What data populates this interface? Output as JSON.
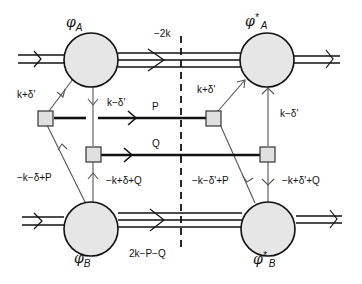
{
  "diagram": {
    "type": "feynman-like cut diagram",
    "colors": {
      "blob_fill": "#e6e6e6",
      "line": "#111111",
      "thin_line": "#555555",
      "vertex_fill": "#e0e0e0"
    },
    "blobs": {
      "phi_A": {
        "symbol": "φ",
        "star": "",
        "sub": "A"
      },
      "phi_A_star": {
        "symbol": "φ",
        "star": "*",
        "sub": "A"
      },
      "phi_B": {
        "symbol": "φ",
        "star": "",
        "sub": "B"
      },
      "phi_B_star": {
        "symbol": "φ",
        "star": "*",
        "sub": "B"
      }
    },
    "labels": {
      "top_momentum": "−2k",
      "bottom_momentum": "2k−P−Q",
      "left_upper": "k+δ'",
      "left_inner": "k−δ'",
      "right_upper": "k+δ'",
      "right_inner": "k−δ'",
      "P": "P",
      "Q": "Q",
      "left_lower_outer": "−k−δ+P",
      "left_lower_inner": "−k+δ+Q",
      "right_lower_outer": "−k−δ'+P",
      "right_lower_inner": "−k+δ'+Q"
    },
    "cut_line": "dashed vertical"
  }
}
